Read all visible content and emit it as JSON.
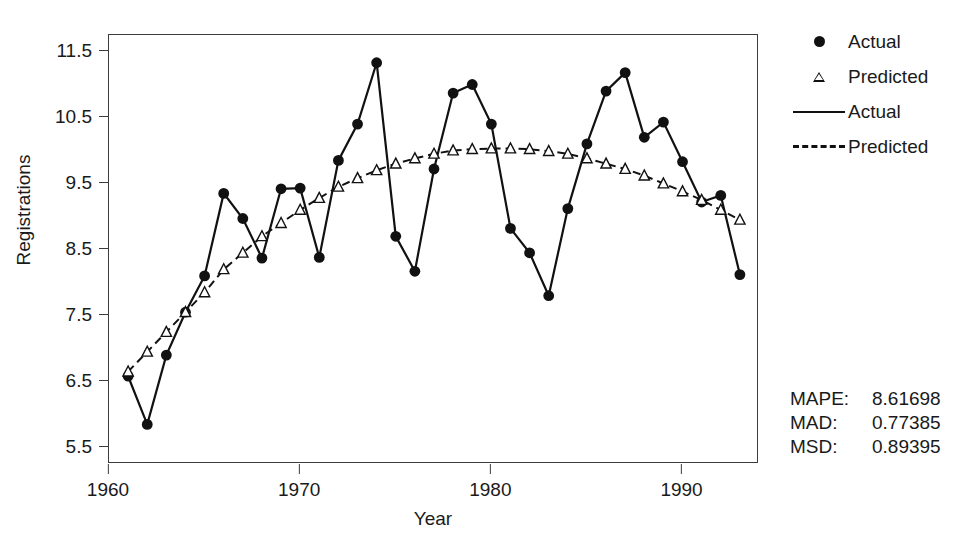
{
  "chart_data": {
    "type": "line",
    "title": "",
    "xlabel": "Year",
    "ylabel": "Registrations",
    "xlim": [
      1960.0,
      1994.0
    ],
    "ylim": [
      5.25,
      11.75
    ],
    "xticks": [
      1960,
      1970,
      1980,
      1990
    ],
    "yticks": [
      5.5,
      6.5,
      7.5,
      8.5,
      9.5,
      10.5,
      11.5
    ],
    "grid": false,
    "legend_position": "right",
    "x": [
      1961,
      1962,
      1963,
      1964,
      1965,
      1966,
      1967,
      1968,
      1969,
      1970,
      1971,
      1972,
      1973,
      1974,
      1975,
      1976,
      1977,
      1978,
      1979,
      1980,
      1981,
      1982,
      1983,
      1984,
      1985,
      1986,
      1987,
      1988,
      1989,
      1990,
      1991,
      1992,
      1993
    ],
    "series": [
      {
        "name": "Actual",
        "marker": "filled-circle",
        "line": "solid",
        "values": [
          6.58,
          5.85,
          6.9,
          7.55,
          8.1,
          9.35,
          8.97,
          8.37,
          9.42,
          9.43,
          8.38,
          9.85,
          10.4,
          11.33,
          8.7,
          8.17,
          9.72,
          10.87,
          11.0,
          10.4,
          8.82,
          8.45,
          7.8,
          9.12,
          10.1,
          10.9,
          11.18,
          10.2,
          10.43,
          9.83,
          9.22,
          9.32,
          8.12
        ]
      },
      {
        "name": "Predicted",
        "marker": "open-triangle",
        "line": "dashed",
        "values": [
          6.65,
          6.95,
          7.25,
          7.55,
          7.85,
          8.2,
          8.45,
          8.7,
          8.9,
          9.1,
          9.28,
          9.45,
          9.58,
          9.7,
          9.8,
          9.88,
          9.95,
          10.0,
          10.02,
          10.03,
          10.03,
          10.02,
          9.99,
          9.95,
          9.88,
          9.8,
          9.72,
          9.62,
          9.5,
          9.38,
          9.25,
          9.1,
          8.95
        ]
      }
    ]
  },
  "legend": {
    "items": [
      {
        "label": "Actual",
        "key": "filled-circle-marker"
      },
      {
        "label": "Predicted",
        "key": "open-triangle-marker"
      },
      {
        "label": "Actual",
        "key": "solid-line"
      },
      {
        "label": "Predicted",
        "key": "dashed-line"
      }
    ]
  },
  "stats": {
    "rows": [
      {
        "name": "MAPE:",
        "value": "8.61698"
      },
      {
        "name": "MAD:",
        "value": "0.77385"
      },
      {
        "name": "MSD:",
        "value": "0.89395"
      }
    ]
  },
  "colors": {
    "foreground": "#111111",
    "axis": "#3c3c3c",
    "background": "#ffffff"
  }
}
